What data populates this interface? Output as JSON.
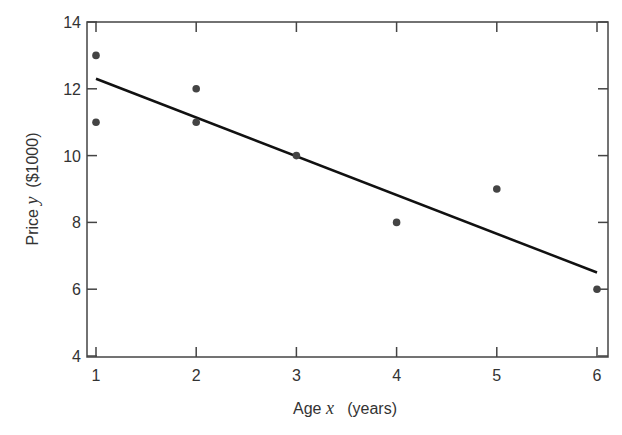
{
  "chart_data": {
    "type": "scatter",
    "title": "",
    "xlabel": "Age x (years)",
    "ylabel": "Price y ($1000)",
    "xlabel_parts": {
      "prefix": "Age ",
      "var": "x",
      "suffix": "   (years)"
    },
    "ylabel_parts": {
      "prefix": "Price ",
      "var": "y",
      "suffix": "  ($1000)"
    },
    "xlim": [
      0.92,
      6.11
    ],
    "ylim": [
      4,
      14
    ],
    "xticks": [
      1,
      2,
      3,
      4,
      5,
      6
    ],
    "yticks": [
      4,
      6,
      8,
      10,
      12,
      14
    ],
    "grid": false,
    "points": [
      {
        "x": 1,
        "y": 13
      },
      {
        "x": 1,
        "y": 11
      },
      {
        "x": 2,
        "y": 12
      },
      {
        "x": 2,
        "y": 11
      },
      {
        "x": 3,
        "y": 10
      },
      {
        "x": 4,
        "y": 8
      },
      {
        "x": 5,
        "y": 9
      },
      {
        "x": 6,
        "y": 6
      }
    ],
    "fit_line": {
      "x": [
        1,
        6
      ],
      "y": [
        12.3,
        6.5
      ],
      "label": "least-squares regression line"
    },
    "colors": {
      "points": "#444444",
      "line": "#111111",
      "axes": "#444444"
    }
  }
}
